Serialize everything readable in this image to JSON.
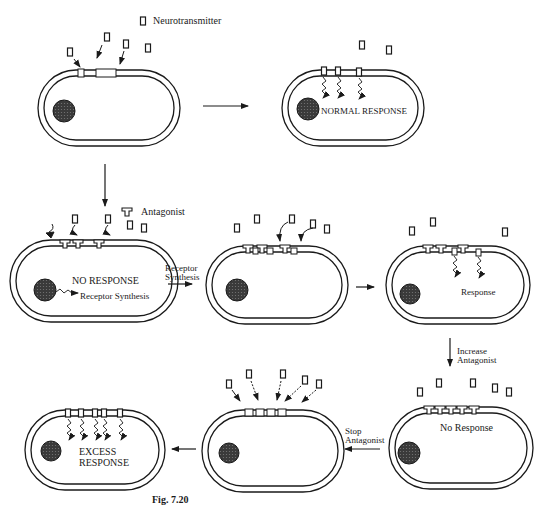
{
  "legend": {
    "neurotransmitter_label": "Neurotransmitter",
    "antagonist_label": "Antagonist"
  },
  "cells": [
    {
      "id": "cell-1",
      "label": ""
    },
    {
      "id": "cell-2",
      "label": "NORMAL RESPONSE"
    },
    {
      "id": "cell-3",
      "label": "NO RESPONSE",
      "sub_label": "Receptor Synthesis"
    },
    {
      "id": "cell-4",
      "label": ""
    },
    {
      "id": "cell-5",
      "label": "Response"
    },
    {
      "id": "cell-6",
      "label": "No Response"
    },
    {
      "id": "cell-7",
      "label": ""
    },
    {
      "id": "cell-8",
      "label_line1": "EXCESS",
      "label_line2": "RESPONSE"
    }
  ],
  "transitions": {
    "receptor_synthesis_line1": "Receptor",
    "receptor_synthesis_line2": "Synthesis",
    "increase_antagonist_line1": "Increase",
    "increase_antagonist_line2": "Antagonist",
    "stop_antagonist_line1": "Stop",
    "stop_antagonist_line2": "Antagonist"
  },
  "caption": "Fig. 7.20"
}
